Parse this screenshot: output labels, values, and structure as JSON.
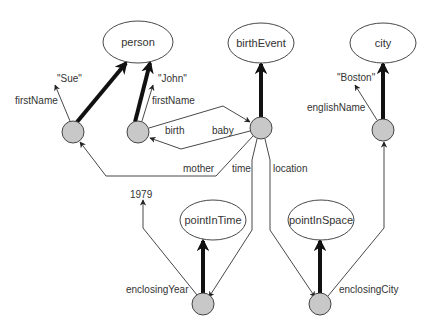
{
  "diagram": {
    "colors": {
      "background": "#ffffff",
      "stroke": "#333333",
      "node_fill": "#c8c8c8",
      "text": "#333333"
    },
    "classes": [
      {
        "id": "person",
        "label": "person",
        "cx": 138,
        "cy": 42,
        "rx": 35,
        "ry": 21
      },
      {
        "id": "birthEvent",
        "label": "birthEvent",
        "cx": 261,
        "cy": 43,
        "rx": 33,
        "ry": 20
      },
      {
        "id": "city",
        "label": "city",
        "cx": 383,
        "cy": 43,
        "rx": 33,
        "ry": 20
      },
      {
        "id": "pointInTime",
        "label": "pointInTime",
        "cx": 213,
        "cy": 220,
        "rx": 33,
        "ry": 20
      },
      {
        "id": "pointInSpace",
        "label": "pointInSpace",
        "cx": 321,
        "cy": 220,
        "rx": 33,
        "ry": 20
      }
    ],
    "instances": [
      {
        "id": "sue",
        "cx": 73,
        "cy": 132,
        "r": 11
      },
      {
        "id": "john",
        "cx": 138,
        "cy": 132,
        "r": 11
      },
      {
        "id": "birth1",
        "cx": 261,
        "cy": 128,
        "r": 11
      },
      {
        "id": "boston",
        "cx": 383,
        "cy": 130,
        "r": 11
      },
      {
        "id": "time1",
        "cx": 203,
        "cy": 304,
        "r": 11
      },
      {
        "id": "space1",
        "cx": 320,
        "cy": 304,
        "r": 11
      }
    ],
    "literals": [
      {
        "id": "sue-literal",
        "label": "\"Sue\"",
        "x": 57,
        "y": 82
      },
      {
        "id": "john-literal",
        "label": "\"John\"",
        "x": 158,
        "y": 82
      },
      {
        "id": "boston-literal",
        "label": "\"Boston\"",
        "x": 337,
        "y": 81
      },
      {
        "id": "year-literal",
        "label": "1979",
        "x": 130,
        "y": 198
      }
    ],
    "edge_labels": [
      {
        "id": "sue-firstName",
        "label": "firstName",
        "x": 15,
        "y": 104
      },
      {
        "id": "john-firstName",
        "label": "firstName",
        "x": 152,
        "y": 104
      },
      {
        "id": "birth",
        "label": "birth",
        "x": 165,
        "y": 134
      },
      {
        "id": "baby",
        "label": "baby",
        "x": 212,
        "y": 134
      },
      {
        "id": "mother",
        "label": "mother",
        "x": 183,
        "y": 172
      },
      {
        "id": "time",
        "label": "time",
        "x": 232,
        "y": 172
      },
      {
        "id": "location",
        "label": "location",
        "x": 273,
        "y": 172
      },
      {
        "id": "englishName",
        "label": "englishName",
        "x": 307,
        "y": 111
      },
      {
        "id": "enclosingYear",
        "label": "enclosingYear",
        "x": 126,
        "y": 293
      },
      {
        "id": "enclosingCity",
        "label": "enclosingCity",
        "x": 339,
        "y": 293
      }
    ]
  }
}
